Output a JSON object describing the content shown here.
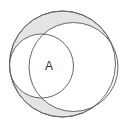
{
  "diagram": {
    "type": "venn",
    "label_a": "A",
    "colors": {
      "background": "#ffffff",
      "shade": "#e4e4e4",
      "stroke": "#666666",
      "text": "#333333"
    },
    "circles": [
      {
        "name": "outer",
        "cx": 62.5,
        "cy": 64,
        "r": 53,
        "shaded": true
      },
      {
        "name": "right",
        "cx": 73.5,
        "cy": 67,
        "r": 44.5,
        "shaded": false
      },
      {
        "name": "left",
        "cx": 41.5,
        "cy": 66,
        "r": 32,
        "shaded": false
      }
    ],
    "shaded_region": "inside outer circle, outside both inner circles"
  }
}
